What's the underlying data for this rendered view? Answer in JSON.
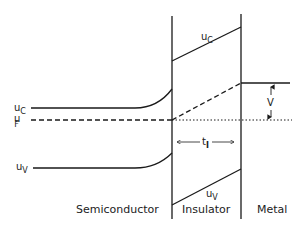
{
  "diagram": {
    "type": "band-diagram",
    "title": "",
    "regions": {
      "semiconductor": "Semiconductor",
      "insulator": "Insulator",
      "metal": "Metal"
    },
    "semiconductor_labels": {
      "conduction_main": "u",
      "conduction_sub": "C",
      "fermi_main": "u",
      "fermi_sub": "F",
      "valence_main": "u",
      "valence_sub": "V"
    },
    "insulator_labels": {
      "conduction_main": "u",
      "conduction_sub": "C",
      "valence_main": "u",
      "valence_sub": "V",
      "thickness_main": "t",
      "thickness_sub": "I"
    },
    "metal_labels": {
      "voltage": "V"
    },
    "colors": {
      "line": "#1a1a1a",
      "background": "#ffffff"
    }
  }
}
